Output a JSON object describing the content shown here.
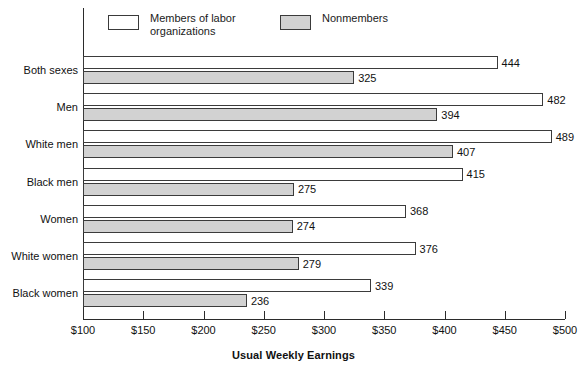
{
  "chart_data": {
    "type": "bar",
    "orientation": "horizontal",
    "title": "",
    "xlabel": "Usual Weekly Earnings",
    "ylabel": "",
    "xlim": [
      100,
      500
    ],
    "xticks": [
      100,
      150,
      200,
      250,
      300,
      350,
      400,
      450,
      500
    ],
    "xtick_labels": [
      "$100",
      "$150",
      "$200",
      "$250",
      "$300",
      "$350",
      "$400",
      "$450",
      "$500"
    ],
    "grid": false,
    "legend_position": "top",
    "categories": [
      "Both sexes",
      "Men",
      "White men",
      "Black men",
      "Women",
      "White women",
      "Black women"
    ],
    "series": [
      {
        "name": "Members of labor organizations",
        "color": "#ffffff",
        "values": [
          444,
          482,
          489,
          415,
          368,
          376,
          339
        ]
      },
      {
        "name": "Nonmembers",
        "color": "#d2d2d2",
        "values": [
          325,
          394,
          407,
          275,
          274,
          279,
          236
        ]
      }
    ]
  },
  "legend": {
    "members_label": "Members of labor\norganizations",
    "nonmembers_label": "Nonmembers"
  },
  "axis": {
    "x_title": "Usual Weekly Earnings"
  },
  "colors": {
    "members_fill": "#ffffff",
    "nonmembers_fill": "#d2d2d2",
    "bar_stroke": "#3b3b3b",
    "axis": "#2b2b2b",
    "text": "#111111"
  }
}
